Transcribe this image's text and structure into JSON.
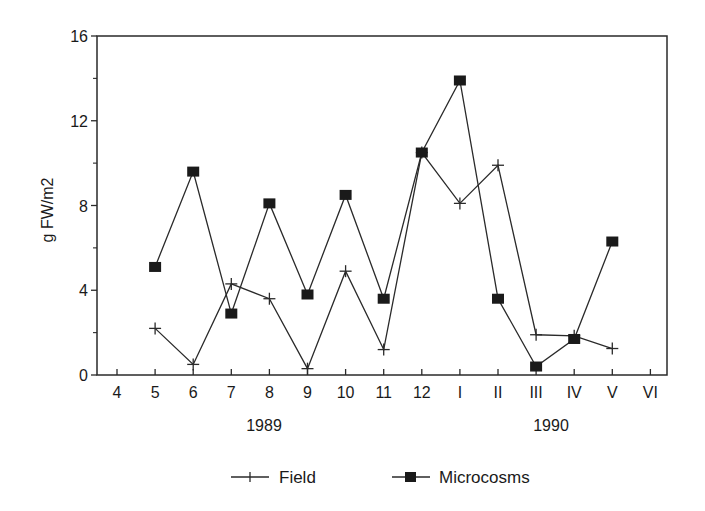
{
  "chart_data": {
    "type": "line",
    "title": "",
    "xlabel": "",
    "ylabel": "g FW/m2",
    "ylim": [
      0,
      16
    ],
    "yticks": [
      "0",
      "4",
      "8",
      "12",
      "16"
    ],
    "yminor_ticks": [
      2,
      6,
      10,
      14
    ],
    "categories": [
      "4",
      "5",
      "6",
      "7",
      "8",
      "9",
      "10",
      "11",
      "12",
      "I",
      "II",
      "III",
      "IV",
      "V",
      "VI"
    ],
    "year_labels": [
      {
        "label": "1989",
        "under_category": "8"
      },
      {
        "label": "1990",
        "under_category": "III"
      }
    ],
    "grid": false,
    "legend_position": "bottom",
    "series": [
      {
        "name": "Field",
        "marker": "plus",
        "values": [
          null,
          2.2,
          0.5,
          4.3,
          3.6,
          0.3,
          4.9,
          1.2,
          10.5,
          8.1,
          9.9,
          1.9,
          1.85,
          1.25,
          null
        ]
      },
      {
        "name": "Microcosms",
        "marker": "filled-square",
        "values": [
          null,
          5.1,
          9.6,
          2.9,
          8.1,
          3.8,
          8.5,
          3.6,
          10.5,
          13.9,
          3.6,
          0.4,
          1.7,
          6.3,
          null
        ]
      }
    ]
  },
  "legend": {
    "field_label": "Field",
    "microcosms_label": "Microcosms"
  },
  "axis": {
    "ylabel": "g FW/m2",
    "year_1989": "1989",
    "year_1990": "1990"
  }
}
